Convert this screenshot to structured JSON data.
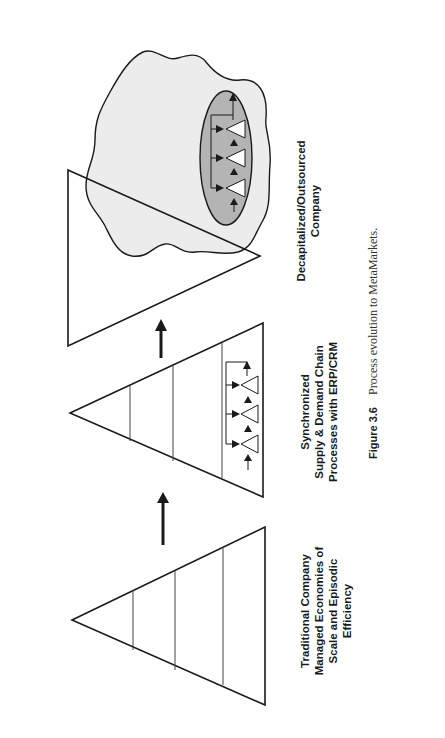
{
  "figure": {
    "stages": [
      {
        "id": "traditional",
        "label_lines": [
          "Traditional Company",
          "Managed Economies of",
          "Scale and Episodic",
          "Efficiency"
        ]
      },
      {
        "id": "synchronized",
        "label_lines": [
          "Synchronized",
          "Supply & Demand Chain",
          "Processes with ERP/CRM"
        ]
      },
      {
        "id": "decapitalized",
        "label_lines": [
          "Decapitalized/Outsourced",
          "Company"
        ]
      }
    ],
    "caption": {
      "number": "Figure 3.6",
      "text": "Process evolution to MetaMarkets."
    },
    "colors": {
      "line": "#1a1a1a",
      "cloud_fill": "#ececec",
      "ellipse_fill": "#b4b4b4",
      "background": "#ffffff"
    },
    "icons": [
      "up-arrow-icon",
      "up-arrow-icon",
      "cloud-shape",
      "process-ellipse",
      "small-triangle-icon"
    ]
  }
}
